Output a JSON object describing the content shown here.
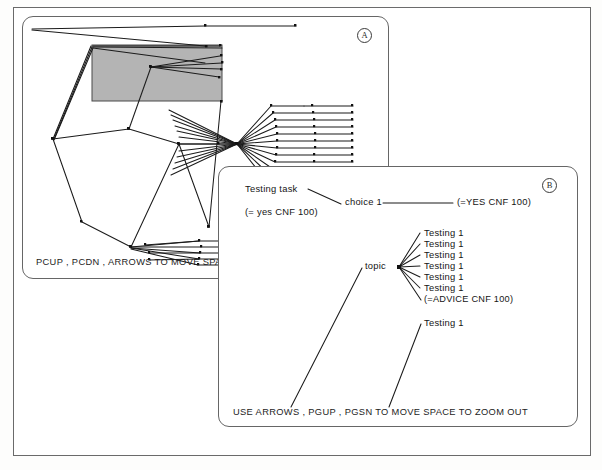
{
  "figure": {
    "background_color": "#ffffff",
    "frame_color": "#6a6a6a",
    "ink_color": "#1b1b1b",
    "highlight_fill": "#b4b4b4"
  },
  "panel_a": {
    "label": "A",
    "status_line": "PCUP , PCDN , ARROWS TO MOVE   SPAC",
    "highlight_region": {
      "x": 91,
      "y": 44,
      "width": 130,
      "height": 56,
      "fill": "#b4b4b4"
    }
  },
  "panel_b": {
    "label": "B",
    "status_line": "USE ARROWS , PGUP , PGSN TO MOVE   SPACE TO ZOOM OUT",
    "nodes": [
      {
        "id": "testing-task",
        "text": "Testing  task",
        "x": 26,
        "y": 22
      },
      {
        "id": "yes-cnf",
        "text": "(= yes CNF 100)",
        "x": 26,
        "y": 45
      },
      {
        "id": "choice-1",
        "text": "choice 1",
        "x": 126,
        "y": 34
      },
      {
        "id": "yes-cnf-100",
        "text": "(=YES CNF 100)",
        "x": 238,
        "y": 34
      },
      {
        "id": "topic",
        "text": "topic",
        "x": 146,
        "y": 99
      },
      {
        "id": "testing-1-a",
        "text": "Testing  1",
        "x": 205,
        "y": 67
      },
      {
        "id": "testing-1-b",
        "text": "Testing  1",
        "x": 205,
        "y": 78
      },
      {
        "id": "testing-1-c",
        "text": "Testing  1",
        "x": 205,
        "y": 89
      },
      {
        "id": "testing-1-d",
        "text": "Testing  1",
        "x": 205,
        "y": 100
      },
      {
        "id": "testing-1-e",
        "text": "Testing  1",
        "x": 205,
        "y": 111
      },
      {
        "id": "testing-1-f",
        "text": "Testing  1",
        "x": 205,
        "y": 122
      },
      {
        "id": "advice-cnf",
        "text": "(=ADVICE CNF 100)",
        "x": 205,
        "y": 134
      },
      {
        "id": "testing-1-g",
        "text": "Testing  1",
        "x": 205,
        "y": 157
      }
    ]
  }
}
